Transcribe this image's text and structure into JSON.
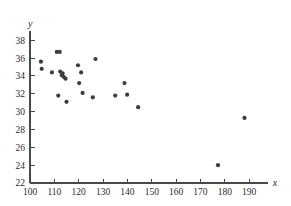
{
  "chart_data": {
    "type": "scatter",
    "title": "",
    "subtitle": "",
    "xlabel": "x",
    "ylabel": "y",
    "xlim": [
      100,
      196
    ],
    "ylim": [
      22,
      39
    ],
    "xticks": [
      100,
      110,
      120,
      130,
      140,
      150,
      160,
      170,
      180,
      190
    ],
    "yticks": [
      22,
      24,
      26,
      28,
      30,
      32,
      34,
      36,
      38
    ],
    "xticklabels": [
      "100",
      "110",
      "120",
      "130",
      "140",
      "150",
      "160",
      "170",
      "180",
      "190"
    ],
    "yticklabels": [
      "22",
      "24",
      "26",
      "28",
      "30",
      "32",
      "34",
      "36",
      "38"
    ],
    "grid": false,
    "legend": null,
    "legend_position": "none",
    "marker": "filled-circle",
    "marker_color": "#3d3d3d",
    "marker_size": 2.1,
    "axis_color": "#4a4a4a",
    "background_color": "#ffffff",
    "annotations": [],
    "points": [
      {
        "x": 104.5,
        "y": 35.6
      },
      {
        "x": 104.8,
        "y": 34.8
      },
      {
        "x": 109.0,
        "y": 34.4
      },
      {
        "x": 111.0,
        "y": 36.7
      },
      {
        "x": 112.2,
        "y": 36.7
      },
      {
        "x": 111.6,
        "y": 31.8
      },
      {
        "x": 112.4,
        "y": 34.5
      },
      {
        "x": 113.0,
        "y": 34.1
      },
      {
        "x": 113.4,
        "y": 34.3
      },
      {
        "x": 113.8,
        "y": 33.9
      },
      {
        "x": 114.6,
        "y": 33.7
      },
      {
        "x": 115.0,
        "y": 31.1
      },
      {
        "x": 119.7,
        "y": 35.2
      },
      {
        "x": 120.2,
        "y": 33.2
      },
      {
        "x": 121.0,
        "y": 34.4
      },
      {
        "x": 121.6,
        "y": 32.1
      },
      {
        "x": 125.8,
        "y": 31.6
      },
      {
        "x": 126.9,
        "y": 35.9
      },
      {
        "x": 135.0,
        "y": 31.8
      },
      {
        "x": 138.8,
        "y": 33.2
      },
      {
        "x": 139.9,
        "y": 31.9
      },
      {
        "x": 144.4,
        "y": 30.5
      },
      {
        "x": 177.2,
        "y": 24.0
      },
      {
        "x": 188.1,
        "y": 29.3
      }
    ]
  }
}
